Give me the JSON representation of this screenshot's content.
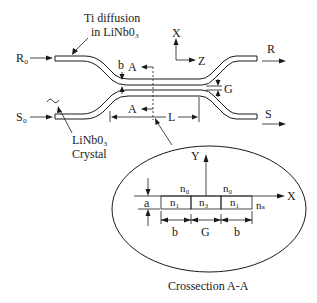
{
  "diagram": {
    "labels": {
      "ti_diffusion_line1": "Ti diffusion",
      "ti_diffusion_line2": "in LiNb0₃",
      "crystal_line1": "LiNb0₃",
      "crystal_line2": "Crystal",
      "input_r": "R₀",
      "input_s": "S₀",
      "output_r": "R",
      "output_s": "S",
      "axis_x": "X",
      "axis_z": "Z",
      "section_top": "A",
      "section_bottom": "A",
      "width_b": "b",
      "gap_g": "G",
      "length_l": "L"
    },
    "crossection": {
      "axis_y": "Y",
      "axis_x": "X",
      "n0_left": "n₀",
      "n0_right": "n₀",
      "thickness_a": "a",
      "cells": [
        "n₁",
        "n₃",
        "n₁"
      ],
      "substrate": "nₛ",
      "dims": [
        "b",
        "G",
        "b"
      ],
      "caption": "Crossection A-A"
    }
  }
}
